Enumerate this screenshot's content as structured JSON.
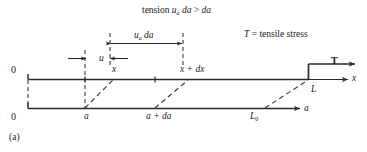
{
  "figure": {
    "caption": "(a)",
    "title_note": "tension",
    "definition_note": "tensile stress",
    "colors": {
      "ink": "#1a1a1a",
      "background": "#ffffff",
      "solid_line": "#2b2b2b",
      "dashed_line": "#3a3a3a"
    }
  },
  "annotations": {
    "tension_condition": {
      "prefix": "tension",
      "quantity_symbol": "u",
      "quantity_subscript": "a",
      "quantity_differential": "da",
      "relation": ">",
      "compared_to": "da"
    },
    "stretched_element": {
      "symbol": "u",
      "subscript": "a",
      "differential": "da"
    },
    "tensile_stress_definition": {
      "symbol": "T",
      "equals": "=",
      "meaning": "tensile stress"
    },
    "displacement": {
      "symbol": "u"
    },
    "applied_tension": {
      "symbol": "T"
    }
  },
  "upper_axis": {
    "name": "deformed-configuration-axis",
    "axis_label": "x",
    "origin_label": "0",
    "ticks": [
      {
        "label": "x",
        "kind": "position"
      },
      {
        "label": "x + dx",
        "kind": "position"
      }
    ],
    "end_label": "L"
  },
  "lower_axis": {
    "name": "reference-configuration-axis",
    "axis_label": "a",
    "origin_label": "0",
    "ticks": [
      {
        "label": "a",
        "kind": "material-coordinate"
      },
      {
        "label": "a + da",
        "kind": "material-coordinate"
      }
    ],
    "end_label": "L",
    "end_label_subscript": "0"
  }
}
